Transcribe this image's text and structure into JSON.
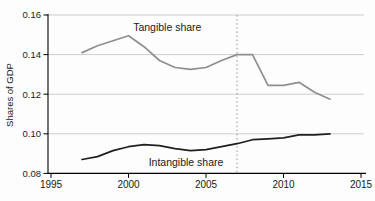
{
  "chart_data": {
    "type": "line",
    "title": "",
    "xlabel": "",
    "ylabel": "Shares of GDP",
    "xlim": [
      1995,
      2015
    ],
    "ylim": [
      0.08,
      0.16
    ],
    "x_ticks": [
      1995,
      2000,
      2005,
      2010,
      2015
    ],
    "y_ticks": [
      0.16,
      0.14,
      0.12,
      0.1,
      0.08
    ],
    "grid": "horizontal-light",
    "legend": "none (direct line labels)",
    "reference_line_x": 2007,
    "reference_line_style": "vertical dotted",
    "x": [
      1997,
      1998,
      1999,
      2000,
      2001,
      2002,
      2003,
      2004,
      2005,
      2006,
      2007,
      2008,
      2009,
      2010,
      2011,
      2012,
      2013
    ],
    "series": [
      {
        "name": "Tangible share",
        "color": "#8f8f8f",
        "values": [
          0.141,
          0.1445,
          0.147,
          0.1495,
          0.144,
          0.137,
          0.1335,
          0.1325,
          0.1335,
          0.137,
          0.14,
          0.14,
          0.1245,
          0.1245,
          0.126,
          0.121,
          0.1175
        ]
      },
      {
        "name": "Intangible share",
        "color": "#1f1f1f",
        "values": [
          0.087,
          0.0885,
          0.0915,
          0.0935,
          0.0945,
          0.094,
          0.0925,
          0.0915,
          0.092,
          0.0935,
          0.095,
          0.097,
          0.0975,
          0.098,
          0.0995,
          0.0995,
          0.1
        ]
      }
    ],
    "annotations": [
      {
        "text": "Tangible share",
        "x": 2000.3,
        "y": 0.152,
        "anchor": "start"
      },
      {
        "text": "Intangible share",
        "x": 2001.3,
        "y": 0.0838,
        "anchor": "start"
      }
    ],
    "colors": {
      "axis": "#000000",
      "gridline": "#cdcdcd",
      "reference_line": "#8a8a8a",
      "text": "#1a1a1a",
      "background": "#fdfdfd"
    }
  }
}
